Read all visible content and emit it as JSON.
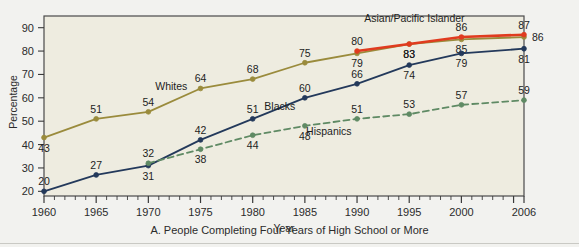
{
  "figure": {
    "caption": "A. People Completing Four Years of High School or More",
    "plot_background": "#eeece0",
    "page_background": "#f2f2ef",
    "frame_color": "#4a4a4a"
  },
  "axes": {
    "ylabel": "Percentage",
    "xlabel": "Year",
    "yticks": [
      20,
      30,
      40,
      50,
      60,
      70,
      80,
      90
    ],
    "xticks": [
      1960,
      1965,
      1970,
      1975,
      1980,
      1985,
      1990,
      1995,
      2000,
      2006
    ],
    "minor_tick_step": 1
  },
  "chart_data": {
    "type": "line",
    "title": "A. People Completing Four Years of High School or More",
    "xlabel": "Year",
    "ylabel": "Percentage",
    "xlim": [
      1960,
      2006
    ],
    "ylim": [
      18,
      95
    ],
    "grid": false,
    "legend": "inline-labels",
    "x": [
      1960,
      1965,
      1970,
      1975,
      1980,
      1985,
      1990,
      1995,
      2000,
      2006
    ],
    "series": [
      {
        "name": "Whites",
        "color": "#9a8b3c",
        "style": "solid",
        "x": [
          1960,
          1965,
          1970,
          1975,
          1980,
          1985,
          1990,
          1995,
          2000,
          2006
        ],
        "values": [
          43,
          51,
          54,
          64,
          68,
          75,
          79,
          83,
          85,
          86
        ],
        "label_positions": [
          "below",
          "above",
          "above",
          "above",
          "above",
          "above",
          "below",
          "below",
          "below",
          "right"
        ]
      },
      {
        "name": "Blacks",
        "color": "#23395b",
        "style": "solid",
        "x": [
          1960,
          1965,
          1970,
          1975,
          1980,
          1985,
          1990,
          1995,
          2000,
          2006
        ],
        "values": [
          20,
          27,
          31,
          42,
          51,
          60,
          66,
          74,
          79,
          81
        ],
        "label_positions": [
          "above",
          "above",
          "below",
          "above",
          "above",
          "above",
          "above",
          "below",
          "below",
          "below"
        ]
      },
      {
        "name": "Hispanics",
        "color": "#5f8a64",
        "style": "dashed",
        "x": [
          1970,
          1975,
          1980,
          1985,
          1990,
          1995,
          2000,
          2006
        ],
        "values": [
          32,
          38,
          44,
          48,
          51,
          53,
          57,
          59
        ],
        "label_positions": [
          "above",
          "below",
          "below",
          "below",
          "above",
          "above",
          "above",
          "above"
        ]
      },
      {
        "name": "Asian/Pacific Islander",
        "color": "#e03b1f",
        "style": "solid",
        "x": [
          1990,
          1995,
          2000,
          2006
        ],
        "values": [
          80,
          83,
          86,
          87
        ],
        "label_positions": [
          "above",
          "below",
          "above",
          "above"
        ]
      }
    ],
    "series_labels": [
      {
        "name": "Whites",
        "x": 1972.2,
        "y": 63.5
      },
      {
        "name": "Blacks",
        "x": 1982.6,
        "y": 55.0
      },
      {
        "name": "Hispanics",
        "x": 1987.3,
        "y": 44.0
      },
      {
        "name": "Asian/Pacific Islander",
        "x": 1995.5,
        "y": 92.5
      }
    ]
  }
}
